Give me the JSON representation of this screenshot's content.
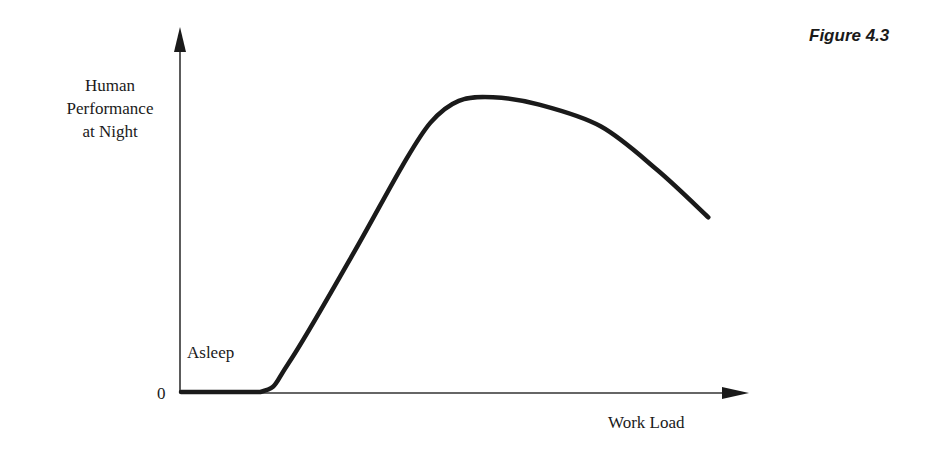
{
  "figure": {
    "title": "Figure 4.3"
  },
  "chart_data": {
    "type": "line",
    "title": "Figure 4.3",
    "xlabel": "Work Load",
    "ylabel": "Human Performance at Night",
    "ylabel_lines": [
      "Human",
      "Performance",
      "at Night"
    ],
    "y_ticks": [
      "0"
    ],
    "annotations": [
      {
        "text": "Asleep",
        "position": "lower-left, above flat zero segment"
      }
    ],
    "grid": false,
    "legend": null,
    "axis_ranges": {
      "x": [
        0,
        1
      ],
      "y": [
        0,
        1
      ]
    },
    "series": [
      {
        "name": "Performance curve",
        "description": "Zero (asleep) at low workload, then rises steeply, peaks at moderate workload, declines at high workload (inverted-U)",
        "x": [
          0.0,
          0.14,
          0.19,
          0.3,
          0.39,
          0.44,
          0.49,
          0.55,
          0.63,
          0.74,
          0.84,
          0.93
        ],
        "y": [
          0.0,
          0.0,
          0.08,
          0.37,
          0.62,
          0.74,
          0.8,
          0.81,
          0.79,
          0.73,
          0.61,
          0.48
        ]
      }
    ],
    "colors": {
      "line": "#1a1a1a",
      "axes": "#333333",
      "background": "#ffffff"
    }
  },
  "labels": {
    "zero": "0",
    "asleep": "Asleep",
    "x_axis": "Work Load",
    "y_axis_lines": [
      "Human",
      "Performance",
      "at Night"
    ]
  }
}
